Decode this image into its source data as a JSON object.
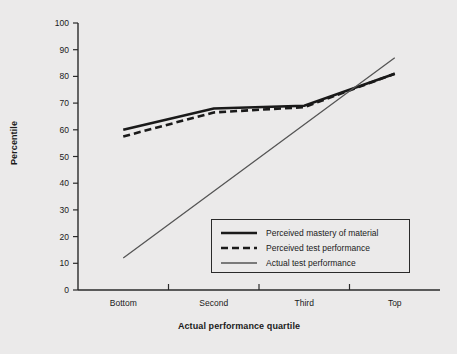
{
  "chart_data": {
    "type": "line",
    "title": "",
    "xlabel": "Actual performance quartile",
    "ylabel": "Percentile",
    "categories": [
      "Bottom",
      "Second",
      "Third",
      "Top"
    ],
    "xtick_labels": [
      "Bottom",
      "Second",
      "Third",
      "Top"
    ],
    "ytick_labels": [
      "0",
      "10",
      "20",
      "30",
      "40",
      "50",
      "60",
      "70",
      "80",
      "90",
      "100"
    ],
    "ylim": [
      0,
      100
    ],
    "ytick_step": 10,
    "grid": false,
    "legend_position": "lower right",
    "series": [
      {
        "name": "Perceived mastery of material",
        "style": "solid-thick",
        "color": "#1a1a1a",
        "values": [
          60,
          68,
          69,
          81
        ]
      },
      {
        "name": "Perceived test performance",
        "style": "dashed-thick",
        "color": "#1a1a1a",
        "values": [
          57.5,
          66.5,
          68.5,
          81
        ]
      },
      {
        "name": "Actual test performance",
        "style": "solid-thin",
        "color": "#555555",
        "values": [
          12,
          37,
          62,
          87
        ]
      }
    ]
  },
  "axes": {
    "y_title": "Percentile",
    "x_title": "Actual performance quartile"
  },
  "legend": {
    "entries": [
      {
        "label": "Perceived mastery of material",
        "swatch": "solid-thick-line-icon"
      },
      {
        "label": "Perceived test performance",
        "swatch": "dashed-thick-line-icon"
      },
      {
        "label": "Actual test performance",
        "swatch": "solid-thin-line-icon"
      }
    ]
  },
  "colors": {
    "background": "#ebeaea",
    "axis": "#2a2a2a",
    "perceived": "#1a1a1a",
    "actual": "#555555"
  }
}
